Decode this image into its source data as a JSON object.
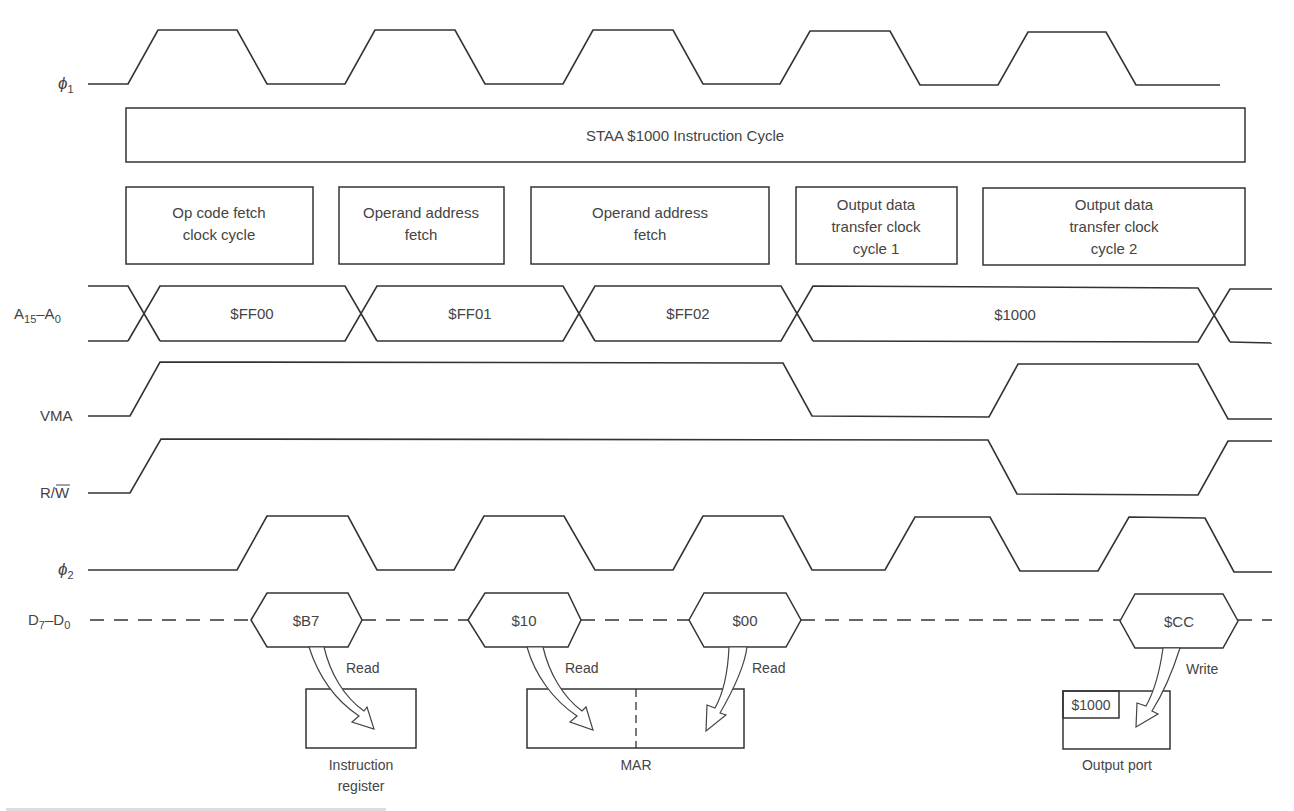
{
  "signals": {
    "phi1": {
      "label": "ϕ",
      "sub": "1"
    },
    "address": {
      "label": "A",
      "sub1": "15",
      "mid": "–A",
      "sub2": "0"
    },
    "vma": {
      "label": "VMA"
    },
    "rw": {
      "label_r": "R/",
      "label_w": "W"
    },
    "phi2": {
      "label": "ϕ",
      "sub": "2"
    },
    "data": {
      "label": "D",
      "sub1": "7",
      "mid": "–D",
      "sub2": "0"
    }
  },
  "instruction_cycle": {
    "title": "STAA $1000 Instruction Cycle"
  },
  "cycles": [
    {
      "lines": [
        "Op code fetch",
        "clock cycle"
      ]
    },
    {
      "lines": [
        "Operand address",
        "fetch"
      ]
    },
    {
      "lines": [
        "Operand address",
        "fetch"
      ]
    },
    {
      "lines": [
        "Output data",
        "transfer clock",
        "cycle 1"
      ]
    },
    {
      "lines": [
        "Output data",
        "transfer clock",
        "cycle 2"
      ]
    }
  ],
  "address_values": [
    "$FF00",
    "$FF01",
    "$FF02",
    "$1000"
  ],
  "data_values": [
    "$B7",
    "$10",
    "$00",
    "$CC"
  ],
  "transfers": [
    {
      "action": "Read",
      "target": "Instruction register"
    },
    {
      "action": "Read",
      "target": "MAR"
    },
    {
      "action": "Read",
      "target": "MAR"
    },
    {
      "action": "Write",
      "target": "Output port"
    }
  ],
  "registers": {
    "instruction_register": {
      "lines": [
        "Instruction",
        "register"
      ]
    },
    "mar": {
      "label": "MAR"
    },
    "output_port": {
      "label": "Output port",
      "address": "$1000"
    }
  },
  "colors": {
    "line": "#333333",
    "text": "#444444",
    "background": "#ffffff"
  }
}
